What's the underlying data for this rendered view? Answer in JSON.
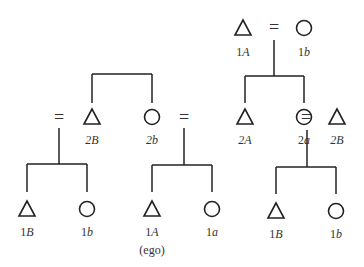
{
  "diagram": {
    "type": "kinship-chart",
    "generation1": {
      "husband": {
        "symbol": "triangle",
        "label_num": "1",
        "label_letter": "A"
      },
      "marriage": "=",
      "wife": {
        "symbol": "circle",
        "label_num": "1",
        "label_letter": "b"
      }
    },
    "generation2": [
      {
        "symbol": "equals",
        "label": "="
      },
      {
        "symbol": "triangle",
        "label_num": "2",
        "label_letter": "B"
      },
      {
        "symbol": "circle",
        "label_num": "2",
        "label_letter": "b"
      },
      {
        "symbol": "equals",
        "label": "="
      },
      {
        "symbol": "triangle",
        "label_num": "2",
        "label_letter": "A"
      },
      {
        "symbol": "circle",
        "label_num": "2",
        "label_letter": "a"
      },
      {
        "symbol": "equals",
        "label": "="
      },
      {
        "symbol": "triangle",
        "label_num": "2",
        "label_letter": "B"
      }
    ],
    "generation3": [
      {
        "symbol": "triangle",
        "label_num": "1",
        "label_letter": "B"
      },
      {
        "symbol": "circle",
        "label_num": "1",
        "label_letter": "b"
      },
      {
        "symbol": "triangle",
        "label_num": "1",
        "label_letter": "A",
        "note": "(ego)"
      },
      {
        "symbol": "circle",
        "label_num": "1",
        "label_letter": "a"
      },
      {
        "symbol": "triangle",
        "label_num": "1",
        "label_letter": "B"
      },
      {
        "symbol": "circle",
        "label_num": "1",
        "label_letter": "b"
      }
    ]
  }
}
